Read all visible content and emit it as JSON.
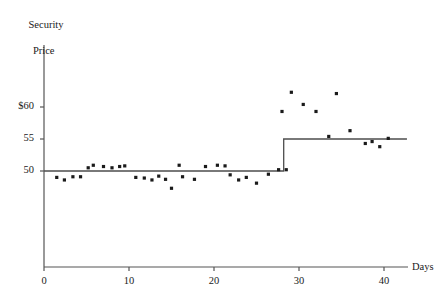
{
  "chart_data": {
    "type": "scatter",
    "title": "",
    "xlabel": "Days",
    "ylabel_line1": "Security",
    "ylabel_line2": "Price",
    "xlim": [
      0,
      44
    ],
    "ylim": [
      38.5,
      73
    ],
    "grid": false,
    "legend": null,
    "xticks": [
      0,
      10,
      20,
      30,
      40
    ],
    "xtick_labels": [
      "0",
      "10",
      "20",
      "30",
      "40"
    ],
    "yticks": [
      50,
      55,
      60
    ],
    "ytick_labels": [
      "50",
      "55",
      "$60"
    ],
    "series": [
      {
        "name": "Security price observations",
        "type": "scatter",
        "marker": "square",
        "color": "#1a1a1a",
        "points": [
          [
            1.5,
            49.0
          ],
          [
            2.4,
            48.6
          ],
          [
            3.4,
            49.1
          ],
          [
            4.3,
            49.1
          ],
          [
            5.2,
            50.5
          ],
          [
            5.8,
            50.9
          ],
          [
            7.0,
            50.7
          ],
          [
            8.0,
            50.5
          ],
          [
            8.9,
            50.7
          ],
          [
            9.5,
            50.8
          ],
          [
            10.8,
            49.0
          ],
          [
            11.8,
            48.9
          ],
          [
            12.7,
            48.6
          ],
          [
            13.5,
            49.2
          ],
          [
            14.3,
            48.7
          ],
          [
            15.0,
            47.3
          ],
          [
            15.9,
            50.9
          ],
          [
            16.3,
            49.1
          ],
          [
            17.7,
            48.7
          ],
          [
            19.0,
            50.7
          ],
          [
            20.4,
            50.9
          ],
          [
            21.3,
            50.8
          ],
          [
            21.9,
            49.4
          ],
          [
            22.9,
            48.6
          ],
          [
            23.8,
            49.0
          ],
          [
            25.0,
            48.1
          ],
          [
            26.4,
            49.5
          ],
          [
            27.6,
            50.2
          ],
          [
            28.0,
            59.3
          ],
          [
            28.5,
            50.2
          ],
          [
            29.1,
            62.3
          ],
          [
            30.5,
            60.4
          ],
          [
            32.0,
            59.3
          ],
          [
            33.5,
            55.4
          ],
          [
            34.4,
            62.1
          ],
          [
            36.0,
            56.3
          ],
          [
            37.8,
            54.3
          ],
          [
            38.6,
            54.6
          ],
          [
            39.5,
            53.8
          ],
          [
            40.5,
            55.1
          ]
        ]
      },
      {
        "name": "Mean price step function",
        "type": "step",
        "color": "#4d4d4d",
        "segments": [
          {
            "x_start": 0.0,
            "x_end": 28.2,
            "y": 50.0
          },
          {
            "x_start": 28.2,
            "x_end": 42.7,
            "y": 55.0
          }
        ]
      }
    ],
    "annotations": []
  },
  "axes": {
    "y_axis_label_top": "Security",
    "y_axis_label_bottom": "Price",
    "x_axis_label": "Days"
  },
  "colors": {
    "marker": "#1a1a1a",
    "line": "#555555",
    "axis": "#555555",
    "text": "#1a1a1a",
    "background": "#ffffff"
  }
}
